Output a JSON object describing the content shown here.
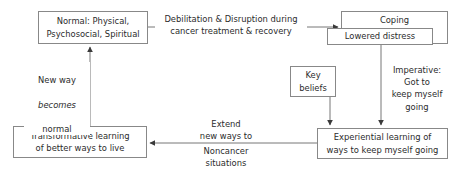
{
  "diagram": {
    "style": {
      "stroke": "#888888",
      "text_color": "#2b2b2b",
      "background": "#ffffff"
    },
    "nodes": {
      "normal": "Normal: Physical,\nPsychosocial, Spiritual",
      "coping": "Coping",
      "lowered_distress": "Lowered distress",
      "key_beliefs": "Key\nbeliefs",
      "transformative": "Transformative learning\nof better ways to live",
      "experiential": "Experiential learning of\nways to keep myself going"
    },
    "edge_labels": {
      "debilitation": "Debilitation & Disruption during\ncancer treatment & recovery",
      "new_way_line1": "New way",
      "new_way_line2": "becomes",
      "new_way_line3": "normal",
      "imperative": "Imperative:\nGot to\nkeep myself\ngoing",
      "extend": "Extend\nnew ways to",
      "noncancer": "Noncancer\nsituations"
    }
  }
}
